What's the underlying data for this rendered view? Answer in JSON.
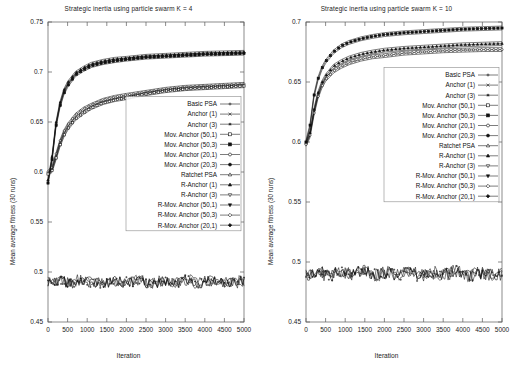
{
  "figure": {
    "width": 515,
    "height": 379,
    "background": "#ffffff",
    "ink": "#101010"
  },
  "shared": {
    "ylabel": "Mean average fitness (30 runs)",
    "xlabel": "Iteration",
    "xticks": [
      0,
      500,
      1000,
      1500,
      2000,
      2500,
      3000,
      3500,
      4000,
      4500,
      5000
    ],
    "legend_entries": [
      {
        "label": "Basic PSA",
        "marker": "plus"
      },
      {
        "label": "Anchor (1)",
        "marker": "cross"
      },
      {
        "label": "Anchor (3)",
        "marker": "star"
      },
      {
        "label": "Mov. Anchor (50,1)",
        "marker": "square-open"
      },
      {
        "label": "Mov. Anchor (50,3)",
        "marker": "square-filled"
      },
      {
        "label": "Mov. Anchor (20,1)",
        "marker": "circle-open"
      },
      {
        "label": "Mov. Anchor (20,3)",
        "marker": "circle-filled"
      },
      {
        "label": "Ratchet PSA",
        "marker": "triangle-open"
      },
      {
        "label": "R-Anchor (1)",
        "marker": "triangle-filled"
      },
      {
        "label": "R-Anchor (3)",
        "marker": "triangle-down-open"
      },
      {
        "label": "R-Mov. Anchor (50,1)",
        "marker": "triangle-down-filled"
      },
      {
        "label": "R-Mov. Anchor (50,3)",
        "marker": "diamond-open"
      },
      {
        "label": "R-Mov. Anchor (20,1)",
        "marker": "diamond-filled"
      },
      {
        "label": "R-Mov. Anchor (20,3)",
        "marker": "circle-open"
      }
    ]
  },
  "chart_data": [
    {
      "type": "line",
      "panel": "left",
      "title": "Strategic inertia using particle swarm K = 4",
      "xlabel": "Iteration",
      "ylabel": "Mean average fitness (30 runs)",
      "xlim": [
        0,
        5000
      ],
      "ylim": [
        0.45,
        0.75
      ],
      "yticks": [
        0.45,
        0.5,
        0.55,
        0.6,
        0.65,
        0.7,
        0.75
      ],
      "xticks": [
        0,
        500,
        1000,
        1500,
        2000,
        2500,
        3000,
        3500,
        4000,
        4500,
        5000
      ],
      "grid": false,
      "legend_position": "inside-right",
      "x": [
        0,
        100,
        200,
        300,
        400,
        500,
        700,
        900,
        1100,
        1400,
        1700,
        2000,
        2500,
        3000,
        3500,
        4000,
        4500,
        5000
      ],
      "series": [
        {
          "name": "Ratchet group (upper bundle)",
          "marker": "triangle-filled",
          "values": [
            0.592,
            0.614,
            0.648,
            0.668,
            0.681,
            0.689,
            0.699,
            0.704,
            0.708,
            0.711,
            0.713,
            0.714,
            0.716,
            0.717,
            0.718,
            0.719,
            0.7195,
            0.72
          ]
        },
        {
          "name": "Ratchet group B (upper bundle)",
          "marker": "square-filled",
          "values": [
            0.589,
            0.611,
            0.645,
            0.665,
            0.678,
            0.686,
            0.697,
            0.702,
            0.706,
            0.709,
            0.711,
            0.7125,
            0.7145,
            0.7155,
            0.7165,
            0.7175,
            0.718,
            0.7185
          ]
        },
        {
          "name": "Anchor group (lower bundle)",
          "marker": "circle-open",
          "values": [
            0.6,
            0.604,
            0.617,
            0.63,
            0.64,
            0.647,
            0.657,
            0.663,
            0.667,
            0.672,
            0.675,
            0.677,
            0.68,
            0.683,
            0.685,
            0.686,
            0.687,
            0.688
          ]
        },
        {
          "name": "Anchor group B (lower bundle)",
          "marker": "square-open",
          "values": [
            0.598,
            0.601,
            0.613,
            0.626,
            0.636,
            0.643,
            0.653,
            0.659,
            0.664,
            0.669,
            0.672,
            0.674,
            0.678,
            0.681,
            0.683,
            0.684,
            0.685,
            0.686
          ]
        },
        {
          "name": "Basic PSA (flat baseline)",
          "marker": "plus",
          "values": [
            0.49,
            0.491,
            0.489,
            0.492,
            0.49,
            0.489,
            0.491,
            0.49,
            0.492,
            0.489,
            0.491,
            0.49,
            0.492,
            0.489,
            0.491,
            0.49,
            0.489,
            0.491
          ]
        }
      ],
      "annotations": [
        "Upper bundle (ratchet variants) plateaus near 0.72",
        "Lower bundle (anchor variants) plateaus near 0.688",
        "Basic PSA remains a noisy flat band near 0.49"
      ]
    },
    {
      "type": "line",
      "panel": "right",
      "title": "Strategic inertia using particle swarm K = 10",
      "xlabel": "Iteration",
      "ylabel": "Mean average fitness (30 runs)",
      "xlim": [
        0,
        5000
      ],
      "ylim": [
        0.45,
        0.7
      ],
      "yticks": [
        0.45,
        0.5,
        0.55,
        0.6,
        0.65,
        0.7
      ],
      "xticks": [
        0,
        500,
        1000,
        1500,
        2000,
        2500,
        3000,
        3500,
        4000,
        4500,
        5000
      ],
      "grid": false,
      "legend_position": "inside-right",
      "x": [
        0,
        100,
        200,
        300,
        400,
        500,
        700,
        900,
        1100,
        1400,
        1700,
        2000,
        2500,
        3000,
        3500,
        4000,
        4500,
        5000
      ],
      "series": [
        {
          "name": "Ratchet group (upper bundle)",
          "marker": "square-filled",
          "values": [
            0.6,
            0.613,
            0.638,
            0.652,
            0.661,
            0.667,
            0.675,
            0.68,
            0.683,
            0.686,
            0.688,
            0.6895,
            0.691,
            0.692,
            0.693,
            0.694,
            0.6945,
            0.695
          ]
        },
        {
          "name": "Anchor group (middle bundle)",
          "marker": "triangle-filled",
          "values": [
            0.599,
            0.607,
            0.626,
            0.64,
            0.649,
            0.655,
            0.663,
            0.667,
            0.67,
            0.673,
            0.675,
            0.6765,
            0.678,
            0.679,
            0.68,
            0.681,
            0.6815,
            0.682
          ]
        },
        {
          "name": "Mov. Anchor group (lower bundle)",
          "marker": "circle-open",
          "values": [
            0.598,
            0.605,
            0.623,
            0.637,
            0.646,
            0.652,
            0.659,
            0.663,
            0.666,
            0.669,
            0.671,
            0.672,
            0.674,
            0.675,
            0.676,
            0.6765,
            0.677,
            0.677
          ]
        },
        {
          "name": "Basic PSA (flat baseline)",
          "marker": "plus",
          "values": [
            0.49,
            0.492,
            0.489,
            0.491,
            0.49,
            0.492,
            0.489,
            0.491,
            0.49,
            0.492,
            0.489,
            0.491,
            0.49,
            0.492,
            0.489,
            0.491,
            0.49,
            0.49
          ]
        }
      ],
      "annotations": [
        "Upper bundle plateaus near 0.695",
        "Middle bundle plateaus near 0.682",
        "Lower bundle plateaus near 0.677",
        "Basic PSA remains a noisy flat band near 0.49"
      ]
    }
  ]
}
